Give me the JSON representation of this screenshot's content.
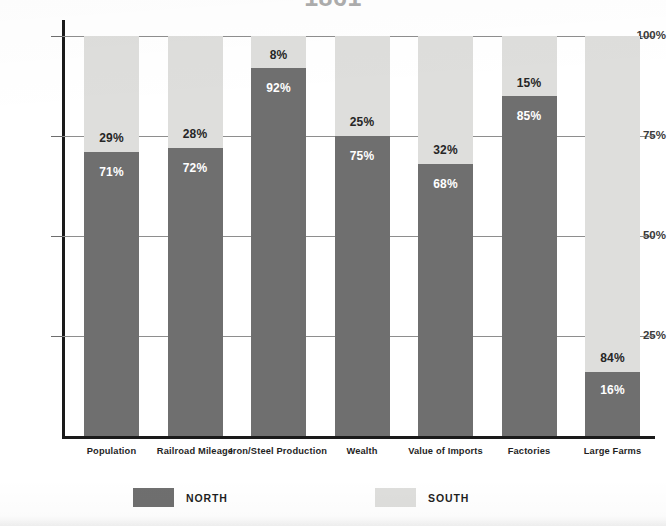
{
  "chart_data": {
    "type": "bar",
    "subtype": "stacked-100-percent",
    "title": "1861",
    "xlabel": "",
    "ylabel": "",
    "ylim": [
      0,
      100
    ],
    "ytick_labels": [
      "25%",
      "50%",
      "75%",
      "100%"
    ],
    "ytick_values": [
      25,
      50,
      75,
      100
    ],
    "grid": true,
    "legend_position": "bottom",
    "categories": [
      "Population",
      "Railroad Mileage",
      "Iron/Steel Production",
      "Wealth",
      "Value of Imports",
      "Factories",
      "Large Farms"
    ],
    "series": [
      {
        "name": "NORTH",
        "color": "#6f6f6f",
        "values": [
          71,
          72,
          92,
          75,
          68,
          85,
          16
        ],
        "labels": [
          "71%",
          "72%",
          "92%",
          "75%",
          "68%",
          "85%",
          "16%"
        ]
      },
      {
        "name": "SOUTH",
        "color": "#dededc",
        "values": [
          29,
          28,
          8,
          25,
          32,
          15,
          84
        ],
        "labels": [
          "29%",
          "28%",
          "8%",
          "25%",
          "32%",
          "15%",
          "84%"
        ]
      }
    ]
  },
  "legend": {
    "items": [
      {
        "label": "NORTH",
        "swatch": "north-swatch"
      },
      {
        "label": "SOUTH",
        "swatch": "south-swatch"
      }
    ]
  },
  "axis": {
    "y_ticks": [
      {
        "label": "100%",
        "value": 100
      },
      {
        "label": "75%",
        "value": 75
      },
      {
        "label": "50%",
        "value": 50
      },
      {
        "label": "25%",
        "value": 25
      }
    ]
  }
}
